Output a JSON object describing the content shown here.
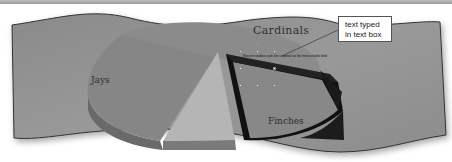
{
  "chart": {
    "labels": {
      "cardinals": "Cardinals",
      "jays": "Jays",
      "finches": "Finches"
    }
  },
  "text_box": {
    "content": "Recent studies rank the cardinal as the most visible bird"
  },
  "callout": {
    "line1": "text typed",
    "line2": "in text box"
  },
  "colors": {
    "background": "#8e8e8e",
    "pie_main": "#868686",
    "pie_light": "#b3b3b3",
    "pie_dark": "#6b6b6b",
    "exploded_slice_outline": "#111111"
  }
}
